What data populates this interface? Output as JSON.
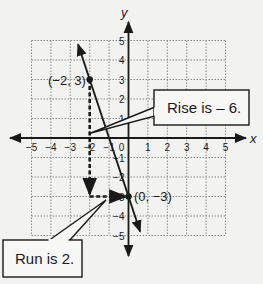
{
  "chart_data": {
    "type": "line",
    "title": "",
    "xlabel": "x",
    "ylabel": "y",
    "xlim": [
      -5,
      5
    ],
    "ylim": [
      -5,
      5
    ],
    "grid": true,
    "x_ticks": [
      -5,
      -4,
      -3,
      -2,
      -1,
      0,
      1,
      2,
      3,
      4,
      5
    ],
    "y_ticks": [
      5,
      4,
      3,
      2,
      1,
      -1,
      -2,
      -3,
      -4,
      -5
    ],
    "x_tick_labels": [
      "−5",
      "−4",
      "−3",
      "−2",
      "−1",
      "0",
      "1",
      "2",
      "3",
      "4",
      "5"
    ],
    "y_tick_labels": [
      "5",
      "4",
      "3",
      "2",
      "1",
      "−1",
      "−2",
      "−3",
      "−4",
      "−5"
    ],
    "series": [
      {
        "name": "line y = -3x - 3",
        "slope": -3,
        "intercept": -3,
        "x": [
          -2.6,
          0.6
        ],
        "y": [
          4.8,
          -4.8
        ],
        "arrows_both_ends": true
      }
    ],
    "points": [
      {
        "x": -2,
        "y": 3,
        "label": "(−2, 3)"
      },
      {
        "x": 0,
        "y": -3,
        "label": "(0, −3)"
      }
    ],
    "annotations": [
      {
        "type": "dashed-arrow",
        "from": [
          -2,
          3
        ],
        "to": [
          -2,
          -3
        ],
        "meaning": "rise"
      },
      {
        "type": "dashed-arrow",
        "from": [
          -2,
          -3
        ],
        "to": [
          0,
          -3
        ],
        "meaning": "run"
      },
      {
        "type": "callout",
        "text": "Rise is – 6."
      },
      {
        "type": "callout",
        "text": "Run is 2."
      }
    ]
  },
  "labels": {
    "x_axis": "x",
    "y_axis": "y",
    "origin": "0",
    "point_a": "(−2, 3)",
    "point_b": "(0, −3)",
    "rise_callout": "Rise is – 6.",
    "run_callout": "Run is 2."
  }
}
